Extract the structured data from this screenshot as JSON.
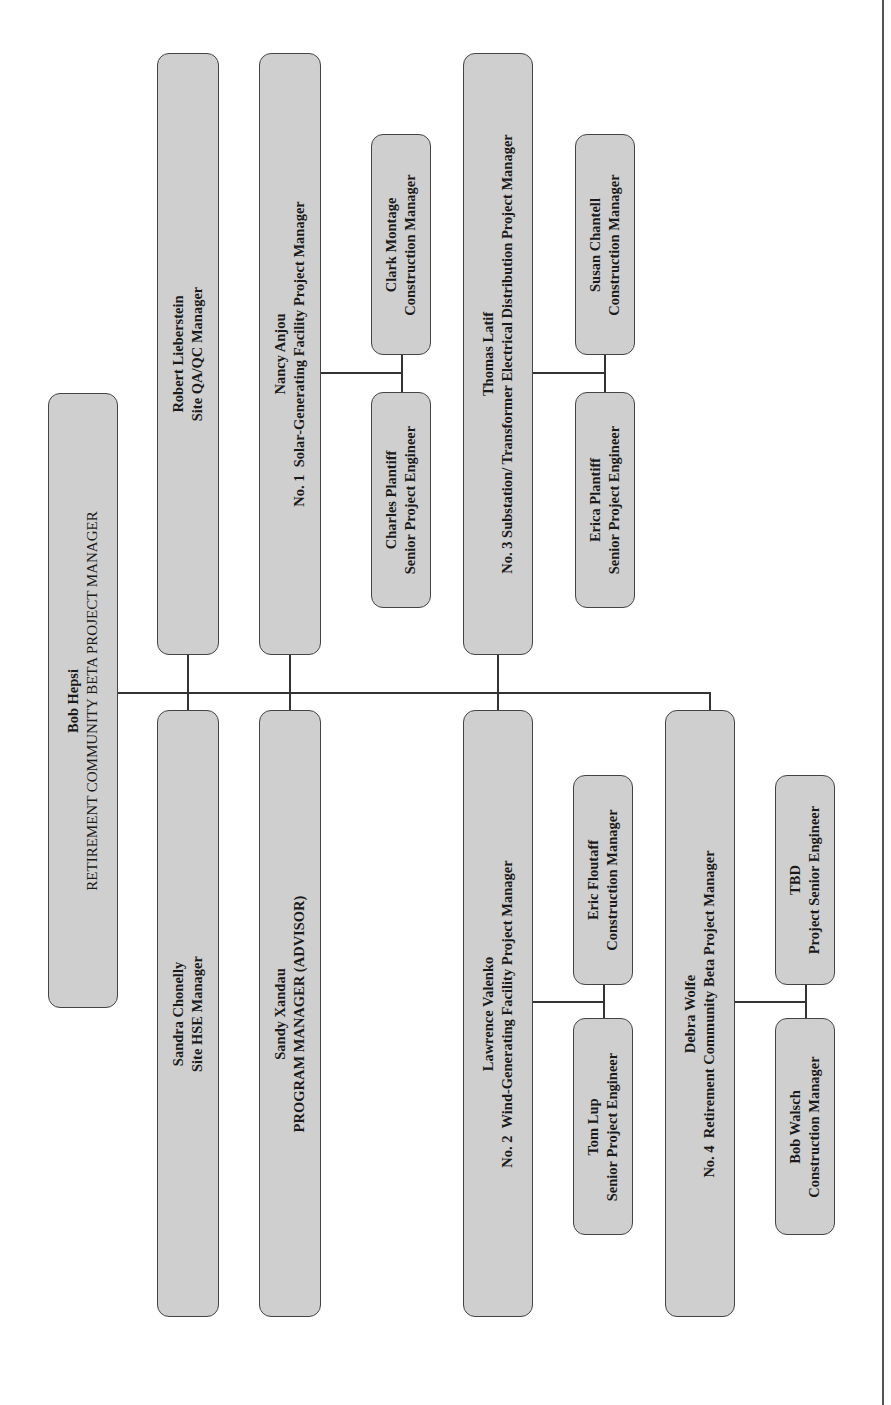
{
  "chart": {
    "orientation": "rotated-90-ccw",
    "box_fill": "#cfcfcf",
    "box_border": "#444444",
    "line_color": "#333333",
    "root": {
      "name": "Bob Hepsi",
      "title": "RETIREMENT COMMUNITY BETA PROJECT MANAGER"
    },
    "staff": [
      {
        "name": "Robert Lieberstein",
        "title": "Site QA/QC Manager"
      },
      {
        "name": "Sandra Chonelly",
        "title": "Site HSE Manager"
      },
      {
        "name": "Sandy Xandau",
        "title": "PROGRAM MANAGER (ADVISOR)"
      }
    ],
    "projects": [
      {
        "name": "Nancy Anjou",
        "title": "No. 1  Solar-Generating Facility Project Manager",
        "reports": [
          {
            "name": "Clark Montage",
            "title": "Construction Manager"
          },
          {
            "name": "Charles Plantiff",
            "title": "Senior Project Engineer"
          }
        ]
      },
      {
        "name": "Lawrence Valenko",
        "title": "No. 2  Wind-Generating Facility Project Manager",
        "reports": [
          {
            "name": "Eric Floutaff",
            "title": "Construction Manager"
          },
          {
            "name": "Tom Lup",
            "title": "Senior Project Engineer"
          }
        ]
      },
      {
        "name": "Thomas Latif",
        "title": "No. 3 Substation/ Transformer Electrical Distribution Project Manager",
        "reports": [
          {
            "name": "Susan Chantell",
            "title": "Construction Manager"
          },
          {
            "name": "Erica Plantiff",
            "title": "Senior Project Engineer"
          }
        ]
      },
      {
        "name": "Debra Wolfe",
        "title": "No. 4  Retirement Community Beta Project Manager",
        "reports": [
          {
            "name": "TBD",
            "title": "Project Senior Engineer"
          },
          {
            "name": "Bob Walsch",
            "title": "Construction Manager"
          }
        ]
      }
    ]
  }
}
